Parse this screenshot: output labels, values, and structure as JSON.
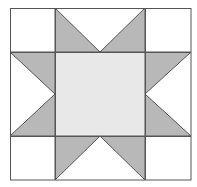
{
  "diagram": {
    "type": "quilt-block",
    "pattern": "sawtooth-star",
    "grid": {
      "x_lines": [
        10,
        55,
        145,
        191
      ],
      "y_lines": [
        8,
        52,
        136,
        180
      ]
    },
    "colors": {
      "background": "#ffffff",
      "corner_fill": "#ffffff",
      "center_fill": "#e8e8e8",
      "star_point_fill": "#b8b8b8",
      "line": "#555555"
    },
    "regions": {
      "corners": [
        "top-left",
        "top-right",
        "bottom-left",
        "bottom-right"
      ],
      "center": "center-square",
      "star_points": [
        {
          "name": "top-left-point",
          "points": "55,8 100,52 55,52"
        },
        {
          "name": "top-right-point",
          "points": "145,8 100,52 145,52"
        },
        {
          "name": "left-top-point",
          "points": "10,52 55,52 55,94"
        },
        {
          "name": "left-bottom-point",
          "points": "10,136 55,94 55,136"
        },
        {
          "name": "right-top-point",
          "points": "191,52 145,52 145,94"
        },
        {
          "name": "right-bottom-point",
          "points": "191,136 145,94 145,136"
        },
        {
          "name": "bottom-left-point",
          "points": "55,180 100,136 55,136"
        },
        {
          "name": "bottom-right-point",
          "points": "145,180 100,136 145,136"
        }
      ]
    }
  }
}
